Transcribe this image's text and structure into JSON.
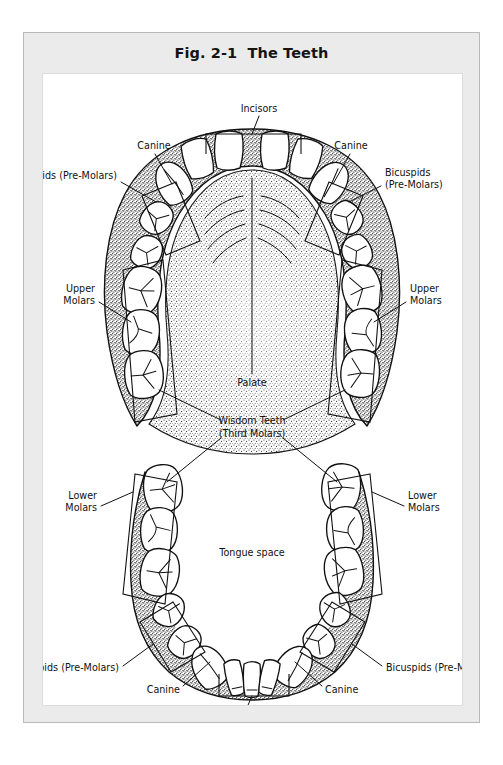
{
  "figure": {
    "title": "Fig. 2-1  The Teeth",
    "title_number": "Fig. 2-1",
    "title_name": "The Teeth"
  },
  "labels": {
    "incisors_top": "Incisors",
    "canine_upper_left": "Canine",
    "canine_upper_right": "Canine",
    "bicuspids_upper_left": "Bicuspids (Pre-Molars)",
    "bicuspids_upper_right_line1": "Bicuspids",
    "bicuspids_upper_right_line2": "(Pre-Molars)",
    "upper_molars_left_line1": "Upper",
    "upper_molars_left_line2": "Molars",
    "upper_molars_right_line1": "Upper",
    "upper_molars_right_line2": "Molars",
    "palate": "Palate",
    "wisdom_line1": "Wisdom Teeth",
    "wisdom_line2": "(Third Molars)",
    "tongue_space": "Tongue space",
    "lower_molars_left_line1": "Lower",
    "lower_molars_left_line2": "Molars",
    "lower_molars_right_line1": "Lower",
    "lower_molars_right_line2": "Molars",
    "bicuspids_lower_left": "Bicuspids (Pre-Molars)",
    "bicuspids_lower_right": "Bicuspids (Pre-Molars)",
    "canine_lower_left": "Canine",
    "canine_lower_right": "Canine",
    "incisors_bottom": "Incisors"
  },
  "colors": {
    "frame_fill": "#ebebeb",
    "frame_border": "#b9b9b9",
    "canvas_fill": "#ffffff",
    "ink": "#111111",
    "tooth_fill": "#ffffff",
    "gum_stipple": "#222222"
  },
  "diagram": {
    "type": "anatomical-illustration",
    "arches": [
      {
        "name": "upper-arch",
        "region_label": "Palate",
        "tooth_groups": [
          {
            "group": "incisors",
            "count": 4,
            "label": "Incisors"
          },
          {
            "group": "canine",
            "count": 2,
            "label": "Canine"
          },
          {
            "group": "bicuspids",
            "count": 4,
            "label": "Bicuspids (Pre-Molars)"
          },
          {
            "group": "molars",
            "count": 6,
            "label": "Upper Molars"
          },
          {
            "group": "third-molars",
            "count": 2,
            "label": "Wisdom Teeth (Third Molars)"
          }
        ]
      },
      {
        "name": "lower-arch",
        "region_label": "Tongue space",
        "tooth_groups": [
          {
            "group": "incisors",
            "count": 4,
            "label": "Incisors"
          },
          {
            "group": "canine",
            "count": 2,
            "label": "Canine"
          },
          {
            "group": "bicuspids",
            "count": 4,
            "label": "Bicuspids (Pre-Molars)"
          },
          {
            "group": "molars",
            "count": 6,
            "label": "Lower Molars"
          },
          {
            "group": "third-molars",
            "count": 2,
            "label": "Wisdom Teeth (Third Molars)"
          }
        ]
      }
    ]
  }
}
